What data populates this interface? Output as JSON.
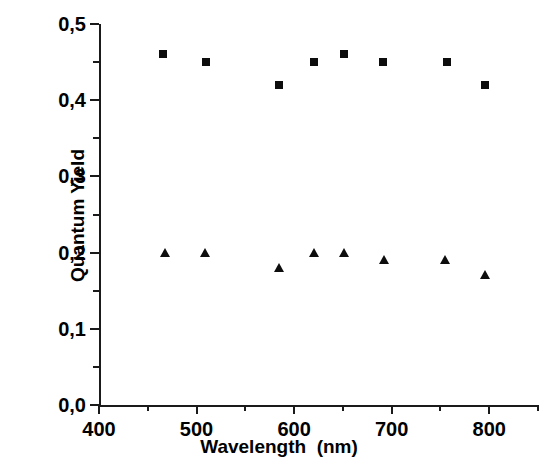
{
  "chart_data": {
    "type": "scatter",
    "title": "",
    "xlabel": "Wavelength  (nm)",
    "ylabel": "Quantum Yield",
    "xlim": [
      400,
      850
    ],
    "ylim": [
      0.0,
      0.5
    ],
    "grid": false,
    "legend": "none",
    "x_ticks": [
      400,
      500,
      600,
      700,
      800
    ],
    "x_tick_labels": [
      "400",
      "500",
      "600",
      "700",
      "800"
    ],
    "x_minor_ticks": [
      450,
      550,
      650,
      750,
      850
    ],
    "y_ticks": [
      0.0,
      0.1,
      0.2,
      0.3,
      0.4,
      0.5
    ],
    "y_tick_labels": [
      "0,0",
      "0,1",
      "0,2",
      "0,3",
      "0,4",
      "0,5"
    ],
    "y_minor_ticks": [
      0.05,
      0.15,
      0.25,
      0.35,
      0.45
    ],
    "series": [
      {
        "name": "squares",
        "marker": "square",
        "color": "#0d0d0d",
        "x": [
          466,
          510,
          585,
          620,
          651,
          691,
          757,
          796
        ],
        "y": [
          0.46,
          0.45,
          0.42,
          0.45,
          0.46,
          0.45,
          0.45,
          0.42
        ]
      },
      {
        "name": "triangles",
        "marker": "triangle",
        "color": "#0d0d0d",
        "x": [
          468,
          509,
          585,
          620,
          651,
          692,
          755,
          796
        ],
        "y": [
          0.2,
          0.2,
          0.18,
          0.2,
          0.2,
          0.19,
          0.19,
          0.17
        ]
      }
    ]
  }
}
